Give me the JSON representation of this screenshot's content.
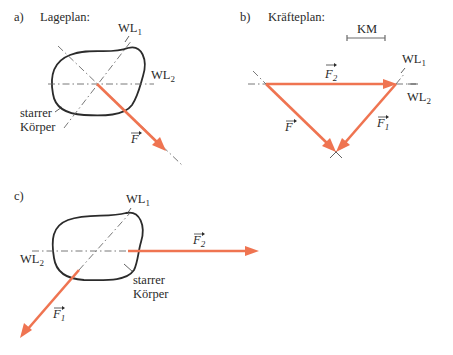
{
  "colors": {
    "force": "#ef7451",
    "outline": "#2b2b2b",
    "axis": "#6a6a6a",
    "text": "#2a2a2a"
  },
  "panel_a": {
    "tag": "a)",
    "title": "Lageplan:",
    "wl1": "WL",
    "wl1_sub": "1",
    "wl2": "WL",
    "wl2_sub": "2",
    "body_label_line1": "starrer",
    "body_label_line2": "Körper",
    "force_label": "F"
  },
  "panel_b": {
    "tag": "b)",
    "title": "Kräfteplan:",
    "scale_label": "KM",
    "wl1": "WL",
    "wl1_sub": "1",
    "wl2": "WL",
    "wl2_sub": "2",
    "f2_label": "F",
    "f2_sub": "2",
    "f_label": "F",
    "f1_label": "F",
    "f1_sub": "1"
  },
  "panel_c": {
    "tag": "c)",
    "wl1": "WL",
    "wl1_sub": "1",
    "wl2": "WL",
    "wl2_sub": "2",
    "f2_label": "F",
    "f2_sub": "2",
    "f1_label": "F",
    "f1_sub": "1",
    "body_label_line1": "starrer",
    "body_label_line2": "Körper"
  }
}
